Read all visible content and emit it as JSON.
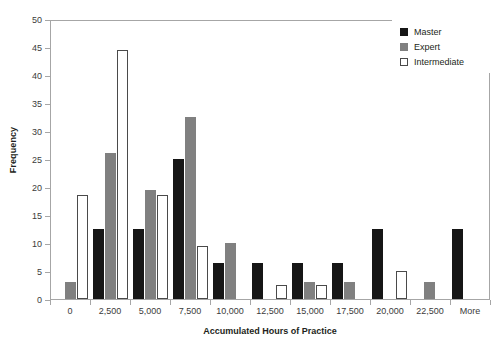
{
  "chart_data": {
    "type": "bar",
    "title": "",
    "xlabel": "Accumulated Hours of Practice",
    "ylabel": "Frequency",
    "ylim": [
      0,
      50
    ],
    "ytick_step": 5,
    "yticks": [
      0,
      5,
      10,
      15,
      20,
      25,
      30,
      35,
      40,
      45,
      50
    ],
    "grid": false,
    "legend_position": "top-right",
    "categories": [
      "0",
      "2,500",
      "5,000",
      "7,500",
      "10,000",
      "12,500",
      "15,000",
      "17,500",
      "20,000",
      "22,500",
      "More"
    ],
    "series": [
      {
        "name": "Master",
        "color": "#161616",
        "values": [
          0,
          12.5,
          12.5,
          25,
          6.5,
          6.5,
          6.5,
          6.5,
          12.5,
          0,
          12.5
        ]
      },
      {
        "name": "Expert",
        "color": "#808080",
        "values": [
          3,
          26,
          19.5,
          32.5,
          10,
          0,
          3,
          3,
          0,
          3,
          0
        ]
      },
      {
        "name": "Intermediate",
        "color": "#ffffff",
        "values": [
          18.5,
          44.5,
          18.5,
          9.5,
          0,
          2.5,
          2.5,
          0,
          5,
          0,
          0
        ]
      }
    ]
  },
  "colors": {
    "master": "#161616",
    "expert": "#808080",
    "intermediate": "#ffffff",
    "axis": "#a6a6a6",
    "text": "#231f20"
  }
}
